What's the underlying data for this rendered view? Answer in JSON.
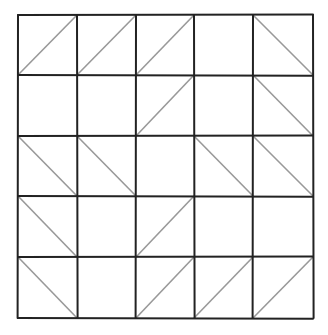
{
  "diagram": {
    "type": "grid-with-diagonals",
    "rows": 5,
    "cols": 5,
    "x_lines": [
      18,
      77,
      136,
      194,
      253,
      313
    ],
    "y_lines": [
      15,
      75,
      136,
      196,
      257,
      318
    ],
    "line_color": "#222222",
    "diagonal_color": "#999999",
    "legend": {
      "/": "bottom-left to top-right",
      "\\": "top-left to bottom-right",
      "": "empty"
    },
    "cells": [
      [
        "/",
        "/",
        "/",
        "",
        "\\"
      ],
      [
        "",
        "",
        "/",
        "",
        "\\"
      ],
      [
        "\\",
        "\\",
        "",
        "\\",
        "\\"
      ],
      [
        "\\",
        "",
        "/",
        "",
        ""
      ],
      [
        "\\",
        "",
        "/",
        "/",
        "/"
      ]
    ]
  }
}
